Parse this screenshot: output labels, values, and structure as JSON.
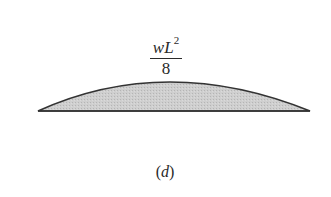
{
  "figure": {
    "label_numerator_var": "wL",
    "label_numerator_exp": "2",
    "label_denominator": "8",
    "caption_open": "(",
    "caption_letter": "d",
    "caption_close": ")",
    "shape": {
      "type": "parabolic-segment",
      "fill": "#c8c8c8",
      "stroke": "#333333",
      "left": [
        38,
        111
      ],
      "right": [
        310,
        111
      ],
      "peak": [
        166,
        82
      ]
    }
  }
}
